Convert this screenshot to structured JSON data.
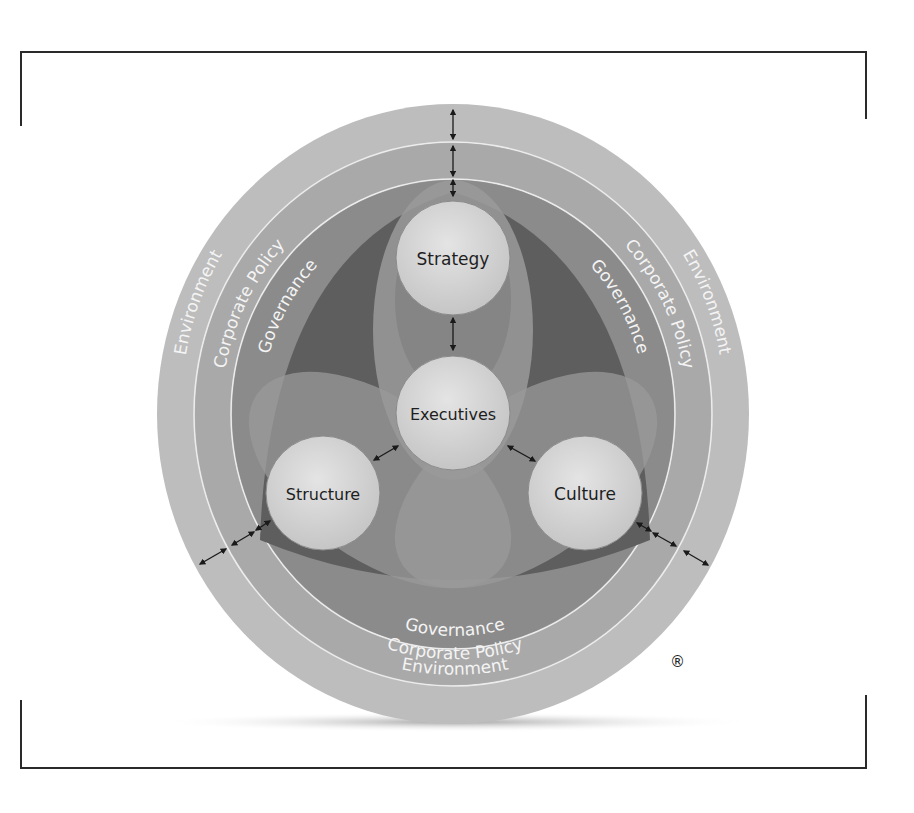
{
  "diagram": {
    "rings": [
      {
        "label": "Environment",
        "color": "#bdbdbd"
      },
      {
        "label": "Corporate Policy",
        "color": "#a9a9a9"
      },
      {
        "label": "Governance",
        "color": "#8b8b8b"
      }
    ],
    "nodes": [
      {
        "id": "strategy",
        "label": "Strategy"
      },
      {
        "id": "executives",
        "label": "Executives"
      },
      {
        "id": "structure",
        "label": "Structure"
      },
      {
        "id": "culture",
        "label": "Culture"
      }
    ],
    "registered_mark": "®",
    "colors": {
      "core_dark": "#5e5e5e",
      "petal": "#9a9a9a",
      "node_fill": "#d9d9d9",
      "ring_divider": "#ececec",
      "arrow": "#1a1a1a"
    }
  }
}
